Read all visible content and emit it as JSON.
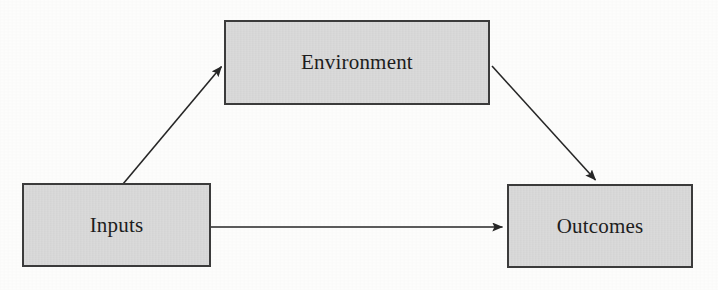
{
  "diagram": {
    "title": "",
    "background_color": "#fdfdfc",
    "node_fill_color": "#d4d4d4",
    "node_border_color": "#3b3b3b",
    "edge_color": "#262626",
    "text_color": "#1d1d1d",
    "nodes": [
      {
        "id": "environment",
        "label": "Environment",
        "x": 224,
        "y": 20,
        "width": 266,
        "height": 85
      },
      {
        "id": "inputs",
        "label": "Inputs",
        "x": 22,
        "y": 183,
        "width": 189,
        "height": 84
      },
      {
        "id": "outcomes",
        "label": "Outcomes",
        "x": 507,
        "y": 184,
        "width": 186,
        "height": 84
      }
    ],
    "edges": [
      {
        "id": "inputs-to-environment",
        "from": "inputs",
        "to": "environment",
        "label": "",
        "arrowhead": "end",
        "x1": 123,
        "y1": 184,
        "x2": 224,
        "y2": 63
      },
      {
        "id": "environment-to-outcomes",
        "from": "environment",
        "to": "outcomes",
        "label": "",
        "arrowhead": "end",
        "x1": 492,
        "y1": 66,
        "x2": 598,
        "y2": 184
      },
      {
        "id": "inputs-to-outcomes",
        "from": "inputs",
        "to": "outcomes",
        "label": "",
        "arrowhead": "end",
        "x1": 211,
        "y1": 227,
        "x2": 506,
        "y2": 227
      }
    ]
  }
}
